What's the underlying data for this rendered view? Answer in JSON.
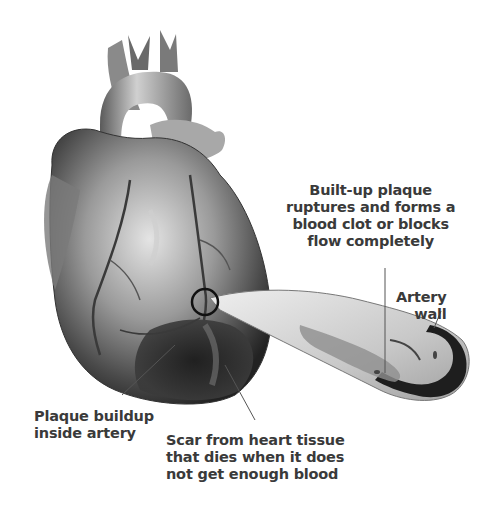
{
  "labels": {
    "plaque_rupture": "Built-up plaque\nruptures and forms a\nblood clot or blocks\nflow completely",
    "artery_wall": "Artery\nwall",
    "plaque_buildup": "Plaque buildup\ninside artery",
    "scar": "Scar from heart tissue\nthat dies when it does\nnot get enough blood"
  },
  "colors": {
    "text": "#3a3a3a",
    "heart_dark": "#2a2a2a",
    "heart_mid": "#7a7a7a",
    "heart_light": "#d8d8d8",
    "artery_wall": "#1e1e1e",
    "artery_inner": "#e6e6e6"
  }
}
